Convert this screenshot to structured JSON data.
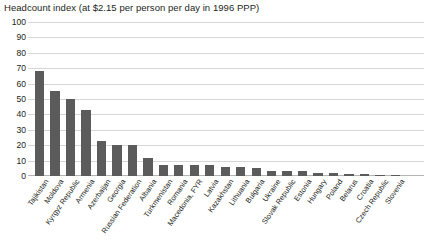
{
  "chart_data": {
    "type": "bar",
    "title": "Headcount index (at $2.15 per person per day in 1996 PPP)",
    "xlabel": "",
    "ylabel": "",
    "ylim": [
      0,
      100
    ],
    "ytick_step": 10,
    "yticks": [
      "100",
      "90",
      "80",
      "70",
      "60",
      "50",
      "40",
      "30",
      "20",
      "10",
      "0"
    ],
    "grid": true,
    "legend": null,
    "bar_color": "#5b5b5b",
    "categories": [
      "Tajikistan",
      "Moldova",
      "Kyrgyz Republic",
      "Armenia",
      "Azerbaijan",
      "Georgia",
      "Russian Federation",
      "Albania",
      "Turkmenistan",
      "Romania",
      "Macedonia, FYR",
      "Latvia",
      "Kazakhstan",
      "Lithuania",
      "Bulgaria",
      "Ukraine",
      "Slovak Republic",
      "Estonia",
      "Hungary",
      "Poland",
      "Belarus",
      "Croatia",
      "Czech Republic",
      "Slovenia"
    ],
    "values": [
      68,
      55,
      50,
      43,
      23,
      20,
      20,
      12,
      7,
      7,
      7,
      7,
      6,
      6,
      5,
      3,
      3,
      3,
      2,
      2,
      1,
      1,
      0.5,
      0.3
    ]
  }
}
